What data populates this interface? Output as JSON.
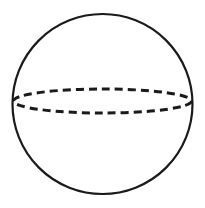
{
  "diagram": {
    "type": "sphere",
    "colors": {
      "stroke": "#1a1a1a",
      "background": "#ffffff"
    }
  }
}
